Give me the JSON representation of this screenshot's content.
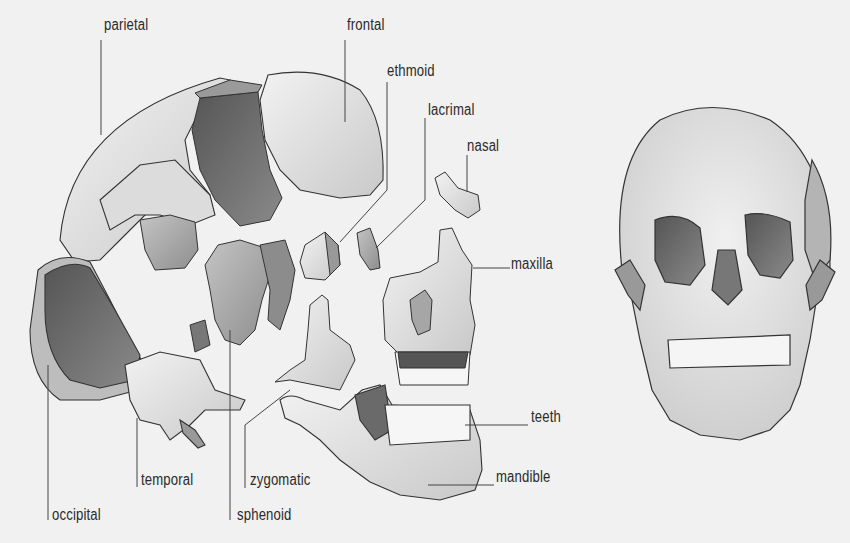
{
  "diagram": {
    "type": "anatomical-illustration",
    "views": [
      "exploded-lateral",
      "frontal"
    ],
    "colors": {
      "background": "#f1f1f1",
      "bone_light": "#e6e6e6",
      "bone_mid": "#b5b5b5",
      "bone_dark": "#6f6f6f",
      "outline": "#333333",
      "leader_line": "#444444"
    },
    "labels": {
      "parietal": {
        "text": "parietal",
        "x": 104,
        "y": 16
      },
      "frontal": {
        "text": "frontal",
        "x": 347,
        "y": 16
      },
      "ethmoid": {
        "text": "ethmoid",
        "x": 387,
        "y": 62
      },
      "lacrimal": {
        "text": "lacrimal",
        "x": 428,
        "y": 101
      },
      "nasal": {
        "text": "nasal",
        "x": 467,
        "y": 137
      },
      "maxilla": {
        "text": "maxilla",
        "x": 511,
        "y": 255
      },
      "teeth": {
        "text": "teeth",
        "x": 531,
        "y": 408
      },
      "mandible": {
        "text": "mandible",
        "x": 496,
        "y": 468
      },
      "temporal": {
        "text": "temporal",
        "x": 141,
        "y": 471
      },
      "zygomatic": {
        "text": "zygomatic",
        "x": 250,
        "y": 471
      },
      "occipital": {
        "text": "occipital",
        "x": 52,
        "y": 506
      },
      "sphenoid": {
        "text": "sphenoid",
        "x": 237,
        "y": 506
      }
    }
  }
}
